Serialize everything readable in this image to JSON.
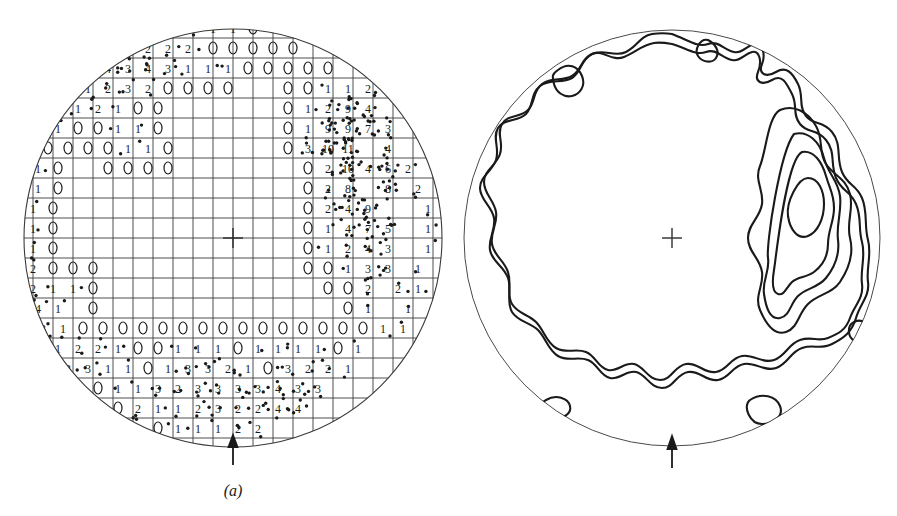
{
  "figure": {
    "type": "two-panel stereographic projection (equal-area pole figure)",
    "background_color": "#ffffff",
    "ink_color": "#1a1a1a",
    "panels": [
      {
        "id": "a",
        "caption": "(a)",
        "kind": "point-count-net",
        "description": "Equal-area projection with counting grid; each grid node is annotated with the number of poles falling within the counting circle, plus the raw scatter of plotted poles.",
        "center": {
          "x": 233,
          "y": 238
        },
        "radius": 210,
        "grid_spacing": 20,
        "circle_marker": "ellipse",
        "center_mark": "cross",
        "bottom_arrow": true
      },
      {
        "id": "b",
        "caption": "(b)",
        "kind": "contour-density",
        "description": "Contoured density diagram derived from the point counts of panel (a); closed maximum on the right-hand side.",
        "center": {
          "x": 672,
          "y": 238
        },
        "radius": 210,
        "center_mark": "cross",
        "bottom_arrow": true,
        "contour_levels": [
          1,
          2,
          3,
          4,
          5,
          6
        ],
        "maximum_location": "east-northeast of centre"
      }
    ]
  },
  "chart_data": {
    "type": "scatter",
    "title": "",
    "xlabel": "",
    "ylabel": "",
    "grid": true,
    "legend_position": "none",
    "projection": "equal-area (Schmidt) net, lower hemisphere",
    "panel_a_counts": [
      {
        "row": 0,
        "y": 28,
        "nodes": [
          {
            "x": 153,
            "n": 2
          },
          {
            "x": 173,
            "n": 2
          },
          {
            "x": 193,
            "n": 1
          },
          {
            "x": 213,
            "n": 1
          },
          {
            "x": 233,
            "n": 1
          },
          {
            "x": 253,
            "n": 0
          },
          {
            "x": 273,
            "n": 1
          }
        ]
      },
      {
        "row": 1,
        "y": 48,
        "nodes": [
          {
            "x": 128,
            "n": 4
          },
          {
            "x": 148,
            "n": 2
          },
          {
            "x": 168,
            "n": 2
          },
          {
            "x": 188,
            "n": 2
          },
          {
            "x": 213,
            "n": 0
          },
          {
            "x": 233,
            "n": 0
          },
          {
            "x": 253,
            "n": 0
          },
          {
            "x": 273,
            "n": 0
          },
          {
            "x": 293,
            "n": 0
          }
        ]
      },
      {
        "row": 2,
        "y": 68,
        "nodes": [
          {
            "x": 108,
            "n": 4
          },
          {
            "x": 128,
            "n": 3
          },
          {
            "x": 148,
            "n": 4
          },
          {
            "x": 168,
            "n": 3
          },
          {
            "x": 188,
            "n": 1
          },
          {
            "x": 208,
            "n": 1
          },
          {
            "x": 228,
            "n": 1
          },
          {
            "x": 248,
            "n": 0
          },
          {
            "x": 268,
            "n": 0
          },
          {
            "x": 288,
            "n": 0
          },
          {
            "x": 308,
            "n": 0
          },
          {
            "x": 328,
            "n": 0
          }
        ]
      },
      {
        "row": 3,
        "y": 88,
        "nodes": [
          {
            "x": 88,
            "n": 1
          },
          {
            "x": 108,
            "n": 2
          },
          {
            "x": 128,
            "n": 3
          },
          {
            "x": 148,
            "n": 2
          },
          {
            "x": 168,
            "n": 0
          },
          {
            "x": 188,
            "n": 0
          },
          {
            "x": 208,
            "n": 0
          },
          {
            "x": 228,
            "n": 0
          },
          {
            "x": 288,
            "n": 0
          },
          {
            "x": 308,
            "n": 0
          },
          {
            "x": 328,
            "n": 1
          },
          {
            "x": 348,
            "n": 1
          },
          {
            "x": 368,
            "n": 2
          }
        ]
      },
      {
        "row": 4,
        "y": 108,
        "nodes": [
          {
            "x": 78,
            "n": 1
          },
          {
            "x": 98,
            "n": 2
          },
          {
            "x": 118,
            "n": 1
          },
          {
            "x": 138,
            "n": 0
          },
          {
            "x": 158,
            "n": 0
          },
          {
            "x": 288,
            "n": 0
          },
          {
            "x": 308,
            "n": 1
          },
          {
            "x": 328,
            "n": 2
          },
          {
            "x": 348,
            "n": 9
          },
          {
            "x": 368,
            "n": 4
          }
        ]
      },
      {
        "row": 5,
        "y": 128,
        "nodes": [
          {
            "x": 58,
            "n": 1
          },
          {
            "x": 78,
            "n": 0
          },
          {
            "x": 98,
            "n": 0
          },
          {
            "x": 118,
            "n": 1
          },
          {
            "x": 138,
            "n": 1
          },
          {
            "x": 158,
            "n": 0
          },
          {
            "x": 288,
            "n": 0
          },
          {
            "x": 308,
            "n": 1
          },
          {
            "x": 328,
            "n": 9
          },
          {
            "x": 348,
            "n": 9
          },
          {
            "x": 368,
            "n": 7
          },
          {
            "x": 388,
            "n": 3
          }
        ]
      },
      {
        "row": 6,
        "y": 148,
        "nodes": [
          {
            "x": 48,
            "n": 0
          },
          {
            "x": 68,
            "n": 0
          },
          {
            "x": 88,
            "n": 0
          },
          {
            "x": 108,
            "n": 0
          },
          {
            "x": 128,
            "n": 1
          },
          {
            "x": 148,
            "n": 1
          },
          {
            "x": 168,
            "n": 0
          },
          {
            "x": 288,
            "n": 0
          },
          {
            "x": 308,
            "n": 3
          },
          {
            "x": 328,
            "n": 10
          },
          {
            "x": 348,
            "n": 11
          },
          {
            "x": 388,
            "n": 4
          }
        ]
      },
      {
        "row": 7,
        "y": 168,
        "nodes": [
          {
            "x": 38,
            "n": 1
          },
          {
            "x": 58,
            "n": 0
          },
          {
            "x": 108,
            "n": 0
          },
          {
            "x": 128,
            "n": 0
          },
          {
            "x": 148,
            "n": 0
          },
          {
            "x": 168,
            "n": 0
          },
          {
            "x": 308,
            "n": 0
          },
          {
            "x": 328,
            "n": 2
          },
          {
            "x": 348,
            "n": 10
          },
          {
            "x": 368,
            "n": 4
          },
          {
            "x": 388,
            "n": 6
          },
          {
            "x": 408,
            "n": 2
          }
        ]
      },
      {
        "row": 8,
        "y": 188,
        "nodes": [
          {
            "x": 38,
            "n": 1
          },
          {
            "x": 58,
            "n": 0
          },
          {
            "x": 308,
            "n": 0
          },
          {
            "x": 328,
            "n": 2
          },
          {
            "x": 348,
            "n": 8
          },
          {
            "x": 388,
            "n": 8
          },
          {
            "x": 418,
            "n": 2
          }
        ]
      },
      {
        "row": 9,
        "y": 208,
        "nodes": [
          {
            "x": 33,
            "n": 1
          },
          {
            "x": 53,
            "n": 0
          },
          {
            "x": 308,
            "n": 0
          },
          {
            "x": 328,
            "n": 2
          },
          {
            "x": 348,
            "n": 4
          },
          {
            "x": 368,
            "n": 9
          },
          {
            "x": 428,
            "n": 1
          }
        ]
      },
      {
        "row": 10,
        "y": 228,
        "nodes": [
          {
            "x": 33,
            "n": 1
          },
          {
            "x": 53,
            "n": 0
          },
          {
            "x": 308,
            "n": 0
          },
          {
            "x": 328,
            "n": 1
          },
          {
            "x": 348,
            "n": 4
          },
          {
            "x": 368,
            "n": 7
          },
          {
            "x": 388,
            "n": 5
          },
          {
            "x": 428,
            "n": 1
          }
        ]
      },
      {
        "row": 11,
        "y": 248,
        "nodes": [
          {
            "x": 33,
            "n": 1
          },
          {
            "x": 53,
            "n": 0
          },
          {
            "x": 308,
            "n": 0
          },
          {
            "x": 328,
            "n": 1
          },
          {
            "x": 348,
            "n": 2
          },
          {
            "x": 368,
            "n": 4
          },
          {
            "x": 388,
            "n": 3
          },
          {
            "x": 428,
            "n": 1
          }
        ]
      },
      {
        "row": 12,
        "y": 268,
        "nodes": [
          {
            "x": 33,
            "n": 2
          },
          {
            "x": 53,
            "n": 0
          },
          {
            "x": 73,
            "n": 0
          },
          {
            "x": 93,
            "n": 0
          },
          {
            "x": 308,
            "n": 0
          },
          {
            "x": 328,
            "n": 0
          },
          {
            "x": 348,
            "n": 1
          },
          {
            "x": 368,
            "n": 3
          },
          {
            "x": 388,
            "n": 3
          },
          {
            "x": 418,
            "n": 1
          }
        ]
      },
      {
        "row": 13,
        "y": 288,
        "nodes": [
          {
            "x": 33,
            "n": 2
          },
          {
            "x": 53,
            "n": 1
          },
          {
            "x": 73,
            "n": 1
          },
          {
            "x": 93,
            "n": 0
          },
          {
            "x": 328,
            "n": 0
          },
          {
            "x": 348,
            "n": 0
          },
          {
            "x": 368,
            "n": 2
          },
          {
            "x": 398,
            "n": 2
          },
          {
            "x": 418,
            "n": 1
          }
        ]
      },
      {
        "row": 14,
        "y": 308,
        "nodes": [
          {
            "x": 38,
            "n": 4
          },
          {
            "x": 58,
            "n": 1
          },
          {
            "x": 93,
            "n": 0
          },
          {
            "x": 348,
            "n": 0
          },
          {
            "x": 368,
            "n": 1
          },
          {
            "x": 408,
            "n": 1
          }
        ]
      },
      {
        "row": 15,
        "y": 328,
        "nodes": [
          {
            "x": 43,
            "n": 3
          },
          {
            "x": 63,
            "n": 1
          },
          {
            "x": 83,
            "n": 0
          },
          {
            "x": 103,
            "n": 0
          },
          {
            "x": 123,
            "n": 0
          },
          {
            "x": 143,
            "n": 0
          },
          {
            "x": 163,
            "n": 0
          },
          {
            "x": 183,
            "n": 0
          },
          {
            "x": 203,
            "n": 0
          },
          {
            "x": 223,
            "n": 0
          },
          {
            "x": 243,
            "n": 0
          },
          {
            "x": 263,
            "n": 0
          },
          {
            "x": 283,
            "n": 0
          },
          {
            "x": 303,
            "n": 0
          },
          {
            "x": 323,
            "n": 0
          },
          {
            "x": 343,
            "n": 0
          },
          {
            "x": 363,
            "n": 0
          },
          {
            "x": 383,
            "n": 1
          },
          {
            "x": 403,
            "n": 1
          }
        ]
      },
      {
        "row": 16,
        "y": 348,
        "nodes": [
          {
            "x": 58,
            "n": 1
          },
          {
            "x": 78,
            "n": 2
          },
          {
            "x": 98,
            "n": 2
          },
          {
            "x": 118,
            "n": 1
          },
          {
            "x": 138,
            "n": 0
          },
          {
            "x": 158,
            "n": 0
          },
          {
            "x": 178,
            "n": 1
          },
          {
            "x": 198,
            "n": 1
          },
          {
            "x": 218,
            "n": 1
          },
          {
            "x": 238,
            "n": 0
          },
          {
            "x": 258,
            "n": 1
          },
          {
            "x": 278,
            "n": 1
          },
          {
            "x": 298,
            "n": 1
          },
          {
            "x": 318,
            "n": 1
          },
          {
            "x": 338,
            "n": 0
          },
          {
            "x": 358,
            "n": 1
          }
        ]
      },
      {
        "row": 17,
        "y": 368,
        "nodes": [
          {
            "x": 68,
            "n": 2
          },
          {
            "x": 88,
            "n": 3
          },
          {
            "x": 108,
            "n": 1
          },
          {
            "x": 128,
            "n": 1
          },
          {
            "x": 148,
            "n": 0
          },
          {
            "x": 168,
            "n": 1
          },
          {
            "x": 188,
            "n": 3
          },
          {
            "x": 208,
            "n": 3
          },
          {
            "x": 228,
            "n": 2
          },
          {
            "x": 248,
            "n": 1
          },
          {
            "x": 268,
            "n": 0
          },
          {
            "x": 288,
            "n": 3
          },
          {
            "x": 308,
            "n": 2
          },
          {
            "x": 328,
            "n": 2
          },
          {
            "x": 348,
            "n": 1
          }
        ]
      },
      {
        "row": 18,
        "y": 388,
        "nodes": [
          {
            "x": 78,
            "n": 0
          },
          {
            "x": 98,
            "n": 0
          },
          {
            "x": 118,
            "n": 1
          },
          {
            "x": 138,
            "n": 1
          },
          {
            "x": 158,
            "n": 3
          },
          {
            "x": 178,
            "n": 2
          },
          {
            "x": 198,
            "n": 3
          },
          {
            "x": 218,
            "n": 3
          },
          {
            "x": 238,
            "n": 3
          },
          {
            "x": 258,
            "n": 3
          },
          {
            "x": 278,
            "n": 4
          },
          {
            "x": 298,
            "n": 3
          },
          {
            "x": 318,
            "n": 3
          }
        ]
      },
      {
        "row": 19,
        "y": 408,
        "nodes": [
          {
            "x": 98,
            "n": 0
          },
          {
            "x": 118,
            "n": 0
          },
          {
            "x": 138,
            "n": 2
          },
          {
            "x": 158,
            "n": 1
          },
          {
            "x": 178,
            "n": 1
          },
          {
            "x": 198,
            "n": 2
          },
          {
            "x": 218,
            "n": 3
          },
          {
            "x": 238,
            "n": 2
          },
          {
            "x": 258,
            "n": 2
          },
          {
            "x": 278,
            "n": 4
          },
          {
            "x": 298,
            "n": 4
          }
        ]
      },
      {
        "row": 20,
        "y": 428,
        "nodes": [
          {
            "x": 138,
            "n": 1
          },
          {
            "x": 158,
            "n": 0
          },
          {
            "x": 178,
            "n": 1
          },
          {
            "x": 198,
            "n": 1
          },
          {
            "x": 218,
            "n": 1
          },
          {
            "x": 238,
            "n": 2
          },
          {
            "x": 258,
            "n": 2
          }
        ]
      }
    ],
    "panel_a_point_cluster_regions": [
      {
        "name": "upper-left arc",
        "approx_center": [
          130,
          70
        ],
        "density": "moderate"
      },
      {
        "name": "right maximum",
        "approx_center": [
          355,
          175
        ],
        "density": "very high"
      },
      {
        "name": "lower arc",
        "approx_center": [
          210,
          395
        ],
        "density": "moderate"
      }
    ],
    "panel_b_contours": [
      {
        "level": 1,
        "closed": false,
        "location": "broad band around the periphery"
      },
      {
        "level": 2,
        "closed": false,
        "location": "inside level-1 band"
      },
      {
        "level": 3,
        "closed": true,
        "location": "right-hand lobe"
      },
      {
        "level": 4,
        "closed": true,
        "location": "right-hand lobe"
      },
      {
        "level": 5,
        "closed": true,
        "location": "right-hand lobe"
      },
      {
        "level": 6,
        "closed": true,
        "location": "innermost maximum, east-northeast"
      }
    ]
  }
}
